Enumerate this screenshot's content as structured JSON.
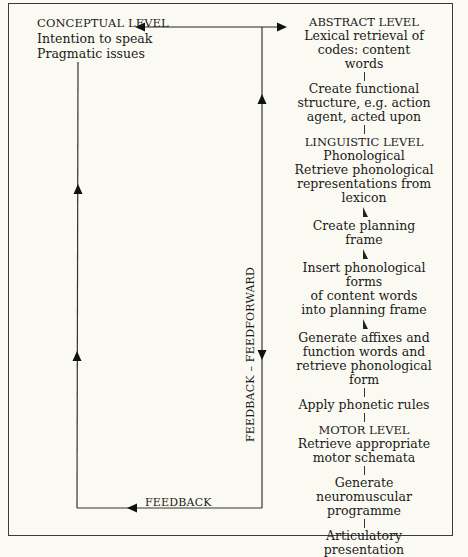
{
  "conceptual": {
    "title": "CONCEPTUAL LEVEL",
    "lines": [
      "Intention to speak",
      "Pragmatic issues"
    ]
  },
  "steps": [
    {
      "kind": "cap",
      "text": "ABSTRACT LEVEL"
    },
    {
      "kind": "text",
      "lines": [
        "Lexical retrieval of",
        "codes: content",
        "words"
      ]
    },
    {
      "kind": "tick"
    },
    {
      "kind": "text",
      "lines": [
        "Create functional",
        "structure, e.g. action",
        "agent, acted upon"
      ]
    },
    {
      "kind": "tick"
    },
    {
      "kind": "cap",
      "text": "LINGUISTIC LEVEL"
    },
    {
      "kind": "text",
      "lines": [
        "Phonological",
        "Retrieve phonological",
        "representations from",
        "lexicon"
      ]
    },
    {
      "kind": "arrow"
    },
    {
      "kind": "text",
      "lines": [
        "Create planning",
        "frame"
      ]
    },
    {
      "kind": "arrow"
    },
    {
      "kind": "text",
      "lines": [
        "Insert phonological forms",
        "of content words",
        "into planning frame"
      ]
    },
    {
      "kind": "arrow"
    },
    {
      "kind": "text",
      "lines": [
        "Generate affixes and",
        "function words and",
        "retrieve phonological form"
      ]
    },
    {
      "kind": "tick"
    },
    {
      "kind": "text",
      "lines": [
        "Apply phonetic rules"
      ]
    },
    {
      "kind": "tick"
    },
    {
      "kind": "cap",
      "text": "MOTOR LEVEL"
    },
    {
      "kind": "text",
      "lines": [
        "Retrieve appropriate",
        "motor schemata"
      ]
    },
    {
      "kind": "tick"
    },
    {
      "kind": "text",
      "lines": [
        "Generate",
        "neuromuscular",
        "programme"
      ]
    },
    {
      "kind": "tick"
    },
    {
      "kind": "text",
      "lines": [
        "Articulatory",
        "presentation"
      ]
    }
  ],
  "labels": {
    "feedback_feedforward": "FEEDBACK – FEEDFORWARD",
    "feedback": "FEEDBACK",
    "caption": "Figure 4.1"
  },
  "colors": {
    "paper": "#fbfaf2",
    "ink": "#1a1a1a"
  }
}
